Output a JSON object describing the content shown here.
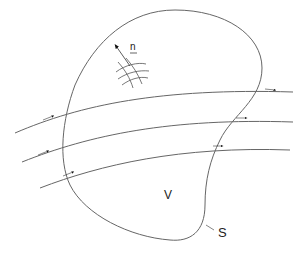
{
  "diagram": {
    "labels": {
      "normal": "n",
      "volume": "V",
      "surface": "S"
    },
    "colors": {
      "stroke": "#666666",
      "arrow": "#111111",
      "text": "#222222"
    },
    "streamline_count": 3
  }
}
